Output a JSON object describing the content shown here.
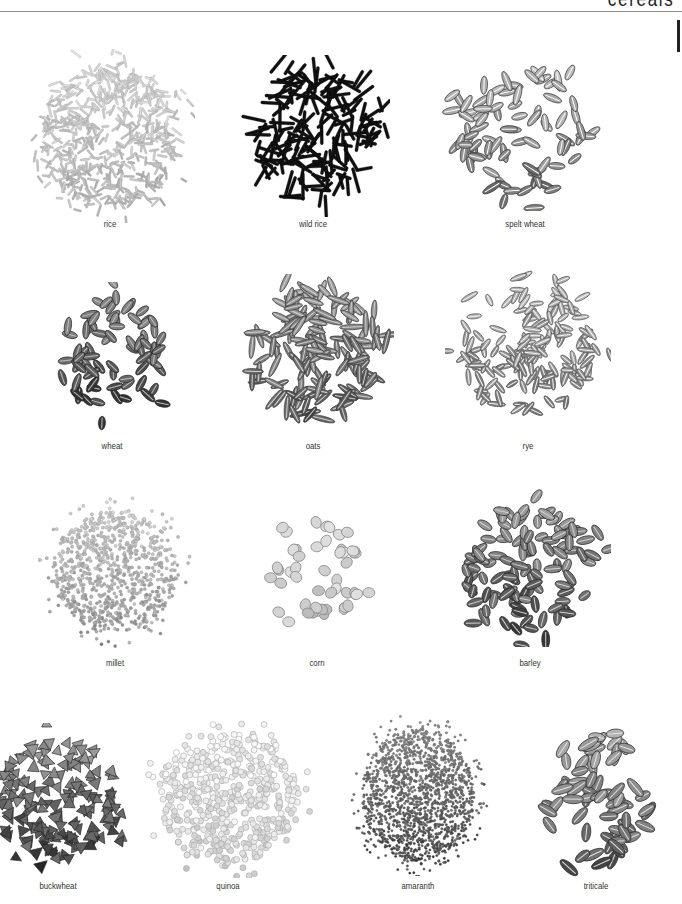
{
  "header": {
    "title": "cereals"
  },
  "grains": [
    {
      "id": "rice",
      "label": "rice",
      "cx": 110,
      "cy": 136,
      "rx": 70,
      "ry": 72,
      "label_y": 218,
      "shape": "needle",
      "count": 520,
      "len": 10,
      "wid": 2.0,
      "fill": "#d8d8d8",
      "stroke": "#9a9a9a",
      "dark": 0.15
    },
    {
      "id": "wild-rice",
      "label": "wild rice",
      "cx": 313,
      "cy": 136,
      "rx": 62,
      "ry": 66,
      "label_y": 218,
      "shape": "needle",
      "count": 170,
      "len": 22,
      "wid": 3.0,
      "fill": "#111111",
      "stroke": "#000000",
      "dark": 0.0
    },
    {
      "id": "spelt-wheat",
      "label": "spelt wheat",
      "cx": 525,
      "cy": 134,
      "rx": 70,
      "ry": 62,
      "label_y": 218,
      "shape": "seed",
      "count": 85,
      "len": 18,
      "wid": 7.0,
      "fill": "#bdbdbd",
      "stroke": "#3a3a3a",
      "dark": 0.35
    },
    {
      "id": "wheat",
      "label": "wheat",
      "cx": 112,
      "cy": 357,
      "rx": 52,
      "ry": 60,
      "label_y": 440,
      "shape": "seed",
      "count": 75,
      "len": 16,
      "wid": 7.0,
      "fill": "#8d8d8d",
      "stroke": "#222222",
      "dark": 0.55
    },
    {
      "id": "oats",
      "label": "oats",
      "cx": 313,
      "cy": 355,
      "rx": 66,
      "ry": 66,
      "label_y": 440,
      "shape": "seed",
      "count": 140,
      "len": 22,
      "wid": 5.5,
      "fill": "#9a9a9a",
      "stroke": "#3a3a3a",
      "dark": 0.45
    },
    {
      "id": "rye",
      "label": "rye",
      "cx": 528,
      "cy": 350,
      "rx": 68,
      "ry": 66,
      "label_y": 440,
      "shape": "seed",
      "count": 150,
      "len": 16,
      "wid": 5.0,
      "fill": "#b5b5b5",
      "stroke": "#555555",
      "dark": 0.3
    },
    {
      "id": "millet",
      "label": "millet",
      "cx": 115,
      "cy": 571,
      "rx": 62,
      "ry": 62,
      "label_y": 657,
      "shape": "dot",
      "count": 900,
      "len": 3.2,
      "wid": 3.2,
      "fill": "#cfcfcf",
      "stroke": "#8a8a8a",
      "dark": 0.25
    },
    {
      "id": "corn",
      "label": "corn",
      "cx": 317,
      "cy": 570,
      "rx": 48,
      "ry": 50,
      "label_y": 657,
      "shape": "kernel",
      "count": 48,
      "len": 12,
      "wid": 10,
      "fill": "#dcdcdc",
      "stroke": "#8a8a8a",
      "dark": 0.1
    },
    {
      "id": "barley",
      "label": "barley",
      "cx": 530,
      "cy": 568,
      "rx": 66,
      "ry": 64,
      "label_y": 657,
      "shape": "seed",
      "count": 120,
      "len": 16,
      "wid": 8.0,
      "fill": "#9c9c9c",
      "stroke": "#252525",
      "dark": 0.5
    },
    {
      "id": "buckwheat",
      "label": "buckwheat",
      "cx": 58,
      "cy": 800,
      "rx": 62,
      "ry": 62,
      "label_y": 880,
      "shape": "tri",
      "count": 170,
      "len": 11,
      "wid": 10,
      "fill": "#9a9a9a",
      "stroke": "#222222",
      "dark": 0.55
    },
    {
      "id": "quinoa",
      "label": "quinoa",
      "cx": 228,
      "cy": 797,
      "rx": 70,
      "ry": 66,
      "label_y": 880,
      "shape": "ring",
      "count": 520,
      "len": 6,
      "wid": 6,
      "fill": "#f2f2f2",
      "stroke": "#a8a8a8",
      "dark": 0.1
    },
    {
      "id": "amaranth",
      "label": "amaranth",
      "cx": 418,
      "cy": 795,
      "rx": 56,
      "ry": 66,
      "label_y": 880,
      "shape": "dot",
      "count": 1700,
      "len": 2.4,
      "wid": 2.4,
      "fill": "#8c8c8c",
      "stroke": "#5a5a5a",
      "dark": 0.5
    },
    {
      "id": "triticale",
      "label": "triticale",
      "cx": 596,
      "cy": 800,
      "rx": 56,
      "ry": 64,
      "label_y": 880,
      "shape": "seed",
      "count": 65,
      "len": 20,
      "wid": 9.0,
      "fill": "#a8a8a8",
      "stroke": "#2a2a2a",
      "dark": 0.45
    }
  ]
}
